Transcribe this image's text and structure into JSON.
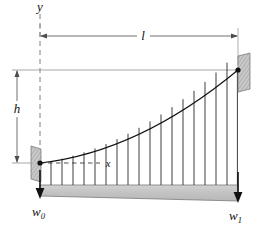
{
  "figure": {
    "kind": "engineering-free-body-diagram",
    "background_color": "#ffffff",
    "line_color": "#1a1a1a",
    "dimension_line_color": "#555555",
    "beam_fill_color": "#c6c6c6",
    "support_fill_color": "#bdbdbd",
    "labels": {
      "y_axis": "y",
      "span": "l",
      "height": "h",
      "coordinate": "x",
      "load_left": "w",
      "load_left_sub": "0",
      "load_right": "w",
      "load_right_sub": "1"
    },
    "geometry": {
      "left_support_x": 40,
      "left_support_y": 163,
      "right_support_x": 238,
      "right_support_y": 70,
      "beam_top_y": 185,
      "beam_bottom_left_y": 196,
      "beam_bottom_right_y": 201,
      "y_axis_x": 40,
      "y_axis_top_y": 14,
      "y_axis_bottom_y": 172,
      "span_dim_y": 36,
      "height_dim_x": 17,
      "load_line_count": 18
    },
    "icon_names": {
      "left_wall": "fixed-support-plate-icon",
      "right_wall": "fixed-support-plate-icon",
      "left_pin": "pin-joint-icon",
      "right_pin": "pin-joint-icon",
      "down_arrow_left": "down-arrow-icon",
      "down_arrow_right": "down-arrow-icon",
      "span_arrow": "double-headed-dimension-arrow-icon",
      "height_arrow": "double-headed-dimension-arrow-icon"
    }
  }
}
